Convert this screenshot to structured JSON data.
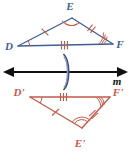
{
  "figure": {
    "colors": {
      "preimage": "#3f5f92",
      "image": "#c2594a",
      "line": "#111111",
      "flip_arrow": "#5b6f93",
      "background": "#ffffff"
    }
  },
  "preimage_triangle": {
    "name": "triangle-DEF",
    "vertices": [
      {
        "label": "D",
        "x": 18,
        "y": 46,
        "label_x": 9,
        "label_y": 50,
        "angle_arcs": 1
      },
      {
        "label": "E",
        "x": 72,
        "y": 18,
        "label_x": 70,
        "label_y": 10,
        "angle_arcs": 2
      },
      {
        "label": "F",
        "x": 113,
        "y": 44,
        "label_x": 118,
        "label_y": 48,
        "angle_arcs": 3
      }
    ],
    "sides": [
      {
        "label": "DE",
        "from": "D",
        "to": "E",
        "tick_marks": 1
      },
      {
        "label": "EF",
        "from": "E",
        "to": "F",
        "tick_marks": 2
      },
      {
        "label": "DF",
        "from": "D",
        "to": "F",
        "tick_marks": 3
      }
    ]
  },
  "mirror_line": {
    "name": "line-m",
    "label": "m",
    "label_x": 117,
    "label_y": 84,
    "y": 72,
    "x_start": 8,
    "x_end": 124,
    "arrowheads": "both",
    "flip_symbol": {
      "name": "flip-arrow",
      "x": 66,
      "y": 72
    }
  },
  "image_triangle": {
    "name": "triangle-D-prime-E-prime-F-prime",
    "vertices": [
      {
        "label": "D'",
        "x": 30,
        "y": 97,
        "label_x": 17,
        "label_y": 95,
        "angle_arcs": 1
      },
      {
        "label": "F'",
        "x": 110,
        "y": 97,
        "label_x": 113,
        "label_y": 95,
        "angle_arcs": 3
      },
      {
        "label": "E'",
        "x": 82,
        "y": 128,
        "label_x": 77,
        "label_y": 146,
        "angle_arcs": 2
      }
    ],
    "sides": [
      {
        "label": "D'F'",
        "from": "D'",
        "to": "F'",
        "tick_marks": 3
      },
      {
        "label": "D'E'",
        "from": "D'",
        "to": "E'",
        "tick_marks": 1
      },
      {
        "label": "E'F'",
        "from": "E'",
        "to": "F'",
        "tick_marks": 2
      }
    ]
  }
}
